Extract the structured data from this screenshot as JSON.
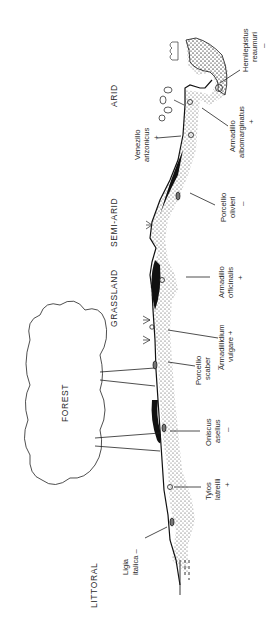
{
  "figure": {
    "orientation": "rotated 90 degrees counterclockwise",
    "zones": [
      {
        "id": "littoral",
        "label": "LITTORAL"
      },
      {
        "id": "forest",
        "label": "FOREST"
      },
      {
        "id": "grassland",
        "label": "GRASSLAND"
      },
      {
        "id": "semi_arid",
        "label": "SEMI-ARID"
      },
      {
        "id": "arid",
        "label": "ARID"
      }
    ],
    "species": [
      {
        "id": "ligia",
        "line1": "Ligia",
        "line2": "italica –",
        "sign": ""
      },
      {
        "id": "tylos",
        "line1": "Tylos",
        "line2": "latreilli",
        "sign": "+"
      },
      {
        "id": "oniscus",
        "line1": "Oniscus",
        "line2": "asellus",
        "sign": "–"
      },
      {
        "id": "porcellio_scaber",
        "line1": "Porcellio",
        "line2": "scaber",
        "sign": "–"
      },
      {
        "id": "armadillidium",
        "line1": "Armadillidium",
        "line2": "vulgare +",
        "sign": ""
      },
      {
        "id": "armadillo_off",
        "line1": "Armadillo",
        "line2": "officinalis",
        "sign": "+"
      },
      {
        "id": "porcellio_oliv",
        "line1": "Porcellio",
        "line2": "olivieri",
        "sign": "–"
      },
      {
        "id": "venezillo",
        "line1": "Venezillo",
        "line2": "arizonicus",
        "sign": "+"
      },
      {
        "id": "armadillo_alb",
        "line1": "Armadillo",
        "line2": "albomarginatus",
        "sign": "+"
      },
      {
        "id": "hemilepistus",
        "line1": "Hemilepistus",
        "line2": "reaumuri",
        "sign": "–"
      }
    ]
  }
}
